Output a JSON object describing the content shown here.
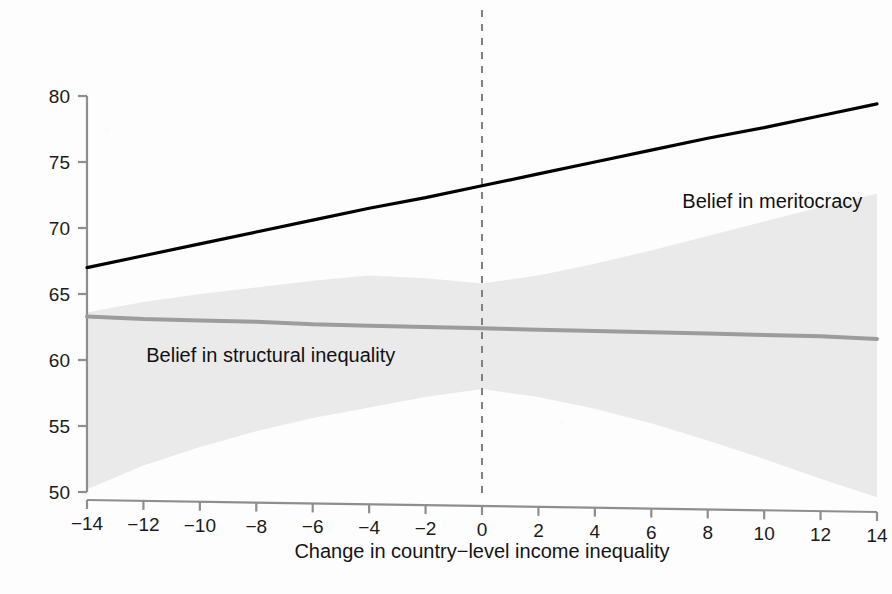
{
  "chart_data": {
    "type": "line",
    "title": "",
    "subtitle": "",
    "xlabel": "Change in country−level income inequality",
    "ylabel": "",
    "xlim": [
      -14,
      14
    ],
    "ylim": [
      50,
      80
    ],
    "xticks": [
      "−14",
      "−12",
      "−10",
      "−8",
      "−6",
      "−4",
      "−2",
      "0",
      "2",
      "4",
      "6",
      "8",
      "10",
      "12",
      "14"
    ],
    "xtick_values": [
      -14,
      -12,
      -10,
      -8,
      -6,
      -4,
      -2,
      0,
      2,
      4,
      6,
      8,
      10,
      12,
      14
    ],
    "yticks": [
      "80",
      "75",
      "70",
      "65",
      "60",
      "55",
      "50"
    ],
    "ytick_values": [
      80,
      75,
      70,
      65,
      60,
      55,
      50
    ],
    "grid": false,
    "legend_position": "inline-annotations",
    "reference_line": {
      "label": "zero-change-reference",
      "x": 0,
      "style": "dashed",
      "color": "#808080"
    },
    "series": [
      {
        "name": "Belief in meritocracy",
        "color": "#000000",
        "linewidth": 3.2,
        "x": [
          -14,
          -12,
          -10,
          -8,
          -6,
          -4,
          -2,
          0,
          2,
          4,
          6,
          8,
          10,
          12,
          14
        ],
        "values": [
          67.0,
          67.9,
          68.8,
          69.7,
          70.6,
          71.5,
          72.3,
          73.2,
          74.1,
          75.0,
          75.9,
          76.8,
          77.6,
          78.5,
          79.4
        ],
        "annotation": {
          "text": "Belief in meritocracy",
          "x": 7.1,
          "y": 72.0
        },
        "confidence_band": null
      },
      {
        "name": "Belief in structural inequality",
        "color": "#9c9c9c",
        "linewidth": 4.0,
        "x": [
          -14,
          -12,
          -10,
          -8,
          -6,
          -4,
          -2,
          0,
          2,
          4,
          6,
          8,
          10,
          12,
          14
        ],
        "values": [
          63.3,
          63.1,
          63.0,
          62.9,
          62.7,
          62.6,
          62.5,
          62.4,
          62.3,
          62.2,
          62.1,
          62.0,
          61.9,
          61.8,
          61.6
        ],
        "annotation": {
          "text": "Belief in structural inequality",
          "x": -11.9,
          "y": 60.3
        },
        "confidence_band": {
          "color": "#e8e8e8",
          "opacity": 0.9,
          "upper": [
            63.6,
            64.4,
            65.0,
            65.5,
            66.0,
            66.4,
            66.2,
            65.8,
            66.4,
            67.3,
            68.3,
            69.4,
            70.5,
            71.6,
            72.6
          ],
          "lower": [
            50.2,
            52.0,
            53.4,
            54.6,
            55.6,
            56.4,
            57.2,
            57.8,
            57.2,
            56.3,
            55.2,
            53.9,
            52.5,
            51.0,
            49.6
          ]
        }
      }
    ]
  },
  "figure": {
    "background_color": "#fdfdfd",
    "axis_color": "#8b8b8b",
    "tick_text_color": "#1b1b1b"
  }
}
